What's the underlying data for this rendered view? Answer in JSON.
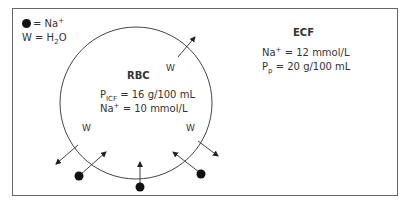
{
  "legend": {
    "sodium_symbol": "= Na",
    "sodium_charge": "+",
    "water_prefix": "W = H",
    "water_sub": "2",
    "water_suffix": "O"
  },
  "rbc": {
    "title": "RBC",
    "protein_label": "P",
    "protein_sub": "ICF",
    "protein_value": "= 16 g/100 mL",
    "sodium_label": "Na",
    "sodium_charge": "+",
    "sodium_value": "= 10 mmol/L"
  },
  "ecf": {
    "title": "ECF",
    "sodium_label": "Na",
    "sodium_charge": "+",
    "sodium_value": "= 12 mmol/L",
    "protein_label": "P",
    "protein_sub": "p",
    "protein_value": "= 20 g/100 mL"
  },
  "arrows": {
    "water_label": "W",
    "water_out_count": 3,
    "sodium_in_count": 3
  },
  "colors": {
    "line": "#444444",
    "dot": "#111111",
    "frame": "#666666"
  }
}
